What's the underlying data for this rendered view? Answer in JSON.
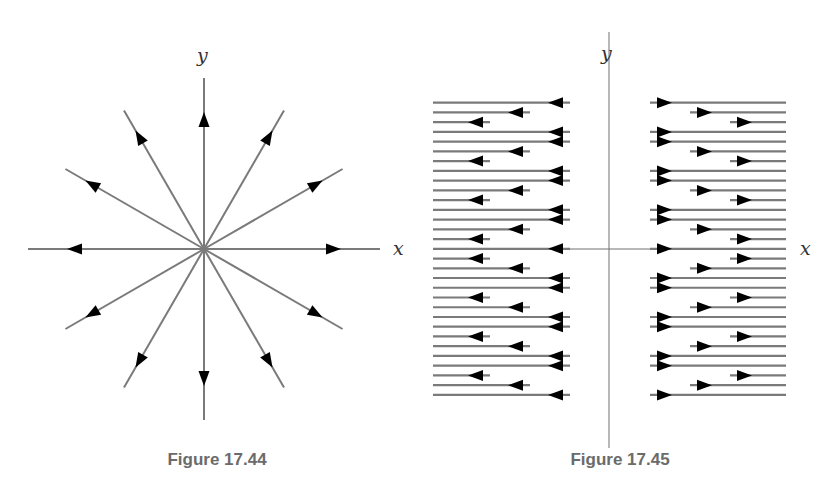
{
  "figures": [
    {
      "id": "fig-17-44",
      "caption": "Figure 17.44",
      "x_label": "x",
      "y_label": "y",
      "description": "Radial vector field: 12 rays from origin at 30° intervals, arrows pointing outward",
      "center": [
        204,
        249
      ],
      "ray_angles_deg": [
        0,
        30,
        60,
        90,
        120,
        150,
        180,
        210,
        240,
        270,
        300,
        330
      ],
      "arrow_direction": "outward"
    },
    {
      "id": "fig-17-45",
      "caption": "Figure 17.45",
      "x_label": "x",
      "y_label": "y",
      "description": "Horizontal flow lines on both sides of y-axis; left side arrows point left, right side arrows point right",
      "row_pattern": [
        "dash",
        "medium",
        "short",
        "long"
      ],
      "row_count": 31,
      "arrow_direction": "away from y-axis"
    }
  ],
  "colors": {
    "line": "#7a7a7a",
    "arrow": "#000000",
    "axis": "#707070",
    "caption": "#6b6b6b"
  }
}
